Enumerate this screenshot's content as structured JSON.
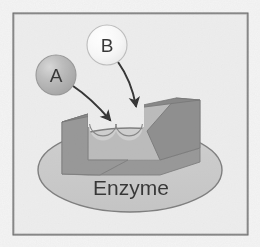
{
  "figure": {
    "name": "enzyme-substrate-binding-diagram",
    "caption_text_visible": false,
    "frame": {
      "name": "image-border-frame",
      "x": 13,
      "y": 13,
      "width": 235,
      "height": 222,
      "stroke_color": "#4a4a4a",
      "stroke_width": 2,
      "background_color": "#ececec"
    },
    "canvas": {
      "width": 260,
      "height": 247,
      "background_color": "#f7f7f7"
    }
  },
  "substrates": [
    {
      "id": "substrate-a",
      "label": "A",
      "shape": "circle",
      "cx": 56,
      "cy": 75,
      "r": 20,
      "fill_color": "#a9a9a9",
      "highlight_color": "#c9c9c9",
      "stroke_color": "#8c8c8c",
      "label_color": "#1d1d1d"
    },
    {
      "id": "substrate-b",
      "label": "B",
      "shape": "circle",
      "cx": 107,
      "cy": 45,
      "r": 20,
      "fill_color": "#f4f4f4",
      "highlight_color": "#fdfdfd",
      "stroke_color": "#b4b4b4",
      "label_color": "#1d1d1d"
    }
  ],
  "arrows": [
    {
      "id": "arrow-a-to-site",
      "from": "substrate-a",
      "to": "active-site-left-notch",
      "path": "M 73 86 C 88 96 98 106 110 120",
      "stroke_color": "#1a1a1a",
      "stroke_width": 2,
      "head_color": "#1a1a1a"
    },
    {
      "id": "arrow-b-to-site",
      "from": "substrate-b",
      "to": "active-site-right-notch",
      "path": "M 118 62 C 128 76 133 90 136 106",
      "stroke_color": "#1a1a1a",
      "stroke_width": 2,
      "head_color": "#1a1a1a"
    }
  ],
  "enzyme": {
    "id": "enzyme-body",
    "label": "Enzyme",
    "label_color": "#1d1d1d",
    "label_x": 131,
    "label_y": 195,
    "ellipse": {
      "name": "enzyme-ellipse",
      "cx": 130,
      "cy": 170,
      "rx": 92,
      "ry": 42,
      "fill_color": "#c3c3c3",
      "stroke_color": "#6e6e6e",
      "stroke_width": 1.4
    },
    "block": {
      "name": "enzyme-active-site-block",
      "front_face_color": "#8a8a8a",
      "inner_face_color": "#b0b0b0",
      "top_face_color": "#7c7c7c",
      "stroke_color": "#6a6a6a",
      "notch_left": {
        "cx": 103,
        "cy": 127,
        "r": 13
      },
      "notch_right": {
        "cx": 129,
        "cy": 127,
        "r": 13
      }
    }
  },
  "legend": {
    "visible": false
  }
}
